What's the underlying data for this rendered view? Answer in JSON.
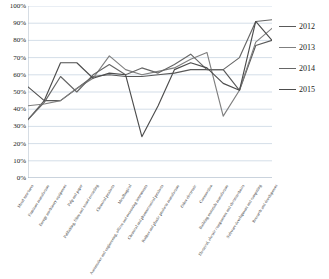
{
  "chart_data": {
    "type": "line",
    "title": "",
    "xlabel": "",
    "ylabel": "",
    "ylim": [
      0,
      100
    ],
    "grid": true,
    "legend_position": "right",
    "y_ticks": [
      "0%",
      "10%",
      "20%",
      "30%",
      "40%",
      "50%",
      "60%",
      "70%",
      "80%",
      "90%",
      "100%"
    ],
    "categories": [
      "Metal structures",
      "Furniture manufacture",
      "Energy machinery equipment",
      "Pulp and paper",
      "Publishing, films and sound recording",
      "Chemical products",
      "Metallurgical",
      "Automotive and engineering, offices and measuring instruments",
      "Chemical and pharmaceutical products",
      "Rubber and plastic products manufacture",
      "Other electronic",
      "Construction",
      "Building materials manufacture",
      "Electrical, electric components and electrotechnics",
      "Software development and computing",
      "Research and development"
    ],
    "series": [
      {
        "name": "2012",
        "color": "#595959",
        "values": [
          34,
          45,
          45,
          52,
          59,
          60,
          59,
          59,
          60,
          61,
          63,
          63,
          63,
          51,
          77,
          80
        ]
      },
      {
        "name": "2013",
        "color": "#7f7f7f",
        "values": [
          42,
          43,
          45,
          52,
          58,
          71,
          63,
          60,
          62,
          64,
          69,
          73,
          36,
          51,
          79,
          87
        ]
      },
      {
        "name": "2014",
        "color": "#666666",
        "values": [
          34,
          44,
          59,
          50,
          60,
          66,
          60,
          64,
          61,
          66,
          72,
          63,
          63,
          70,
          91,
          92
        ]
      },
      {
        "name": "2015",
        "color": "#4d4d4d",
        "values": [
          53,
          45,
          67,
          67,
          58,
          61,
          60,
          24,
          42,
          63,
          67,
          64,
          55,
          51,
          91,
          80
        ]
      }
    ]
  }
}
